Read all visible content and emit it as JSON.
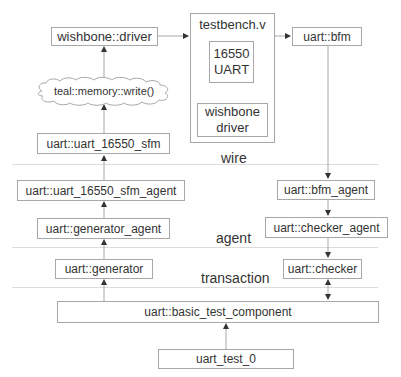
{
  "diagram": {
    "top": {
      "wishbone_driver": "wishbone::driver",
      "testbench": {
        "title": "testbench.v",
        "uart_line1": "16550",
        "uart_line2": "UART",
        "wb_line1": "wishbone",
        "wb_line2": "driver"
      },
      "bfm": "uart::bfm",
      "memory_write": "teal::memory::write()"
    },
    "left_column": {
      "sfm": "uart::uart_16550_sfm",
      "sfm_agent": "uart::uart_16550_sfm_agent",
      "generator_agent": "uart::generator_agent",
      "generator": "uart::generator"
    },
    "right_column": {
      "bfm_agent": "uart::bfm_agent",
      "checker_agent": "uart::checker_agent",
      "checker": "uart::checker"
    },
    "layers": {
      "wire": "wire",
      "agent": "agent",
      "transaction": "transaction"
    },
    "bottom": {
      "basic_test_component": "uart::basic_test_component",
      "test": "uart_test_0"
    },
    "colors": {
      "border": "#a8a8a8",
      "separator": "#dcdcdc",
      "arrow": "#333333",
      "text": "#333333"
    }
  }
}
